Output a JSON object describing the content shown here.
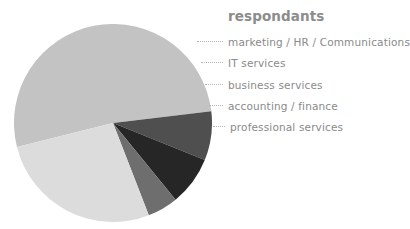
{
  "chart_data": {
    "type": "pie",
    "title": "respondants",
    "xlabel": "",
    "ylabel": "",
    "legend_position": "right",
    "grid": false,
    "categories": [
      "marketing / HR / Communications",
      "IT services",
      "business services",
      "accounting / finance",
      "professional services"
    ],
    "values": [
      52,
      8,
      8,
      5,
      27
    ],
    "colors": [
      "#c3c3c3",
      "#4f4f4f",
      "#262626",
      "#6e6e6e",
      "#dcdcdc"
    ],
    "slices": [
      {
        "label": "marketing / HR / Communications",
        "value": 52,
        "color": "#c3c3c3"
      },
      {
        "label": "IT services",
        "value": 8,
        "color": "#4f4f4f"
      },
      {
        "label": "business services",
        "value": 8,
        "color": "#262626"
      },
      {
        "label": "accounting / finance",
        "value": 5,
        "color": "#6e6e6e"
      },
      {
        "label": "professional services",
        "value": 27,
        "color": "#dcdcdc"
      }
    ]
  },
  "legend": {
    "title": "respondants",
    "items": [
      {
        "label": "marketing / HR / Communications"
      },
      {
        "label": "IT services"
      },
      {
        "label": "business services"
      },
      {
        "label": "accounting / finance"
      },
      {
        "label": "professional services"
      }
    ]
  }
}
